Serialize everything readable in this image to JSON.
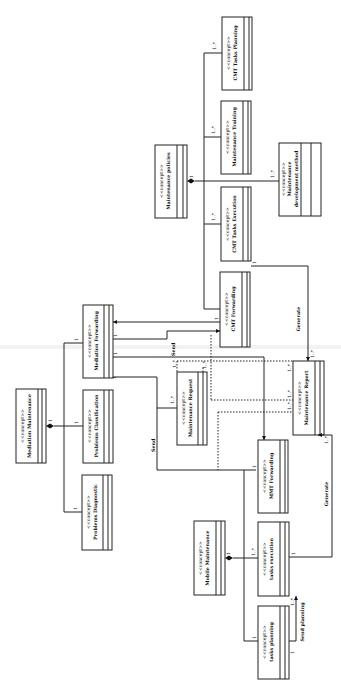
{
  "diagram": {
    "orientation": "rotated-90-ccw",
    "stereotype": "<<concept>>",
    "concepts": [
      {
        "id": "mediation_maintenance",
        "name": "Mediation Maintenance"
      },
      {
        "id": "problems_diagnostic",
        "name": "Problems Diagnostic"
      },
      {
        "id": "problems_classification",
        "name": "Problems Classification"
      },
      {
        "id": "mediation_forwarding",
        "name": "Mediation Forwarding"
      },
      {
        "id": "maintenance_request_small",
        "name": "Maintenance Request"
      },
      {
        "id": "cmt_forwarding",
        "name": "CMT Forwarding"
      },
      {
        "id": "cmt_tasks_execution",
        "name": "CMT Tasks Execution"
      },
      {
        "id": "maintenance_policies",
        "name": "Maintenance policies"
      },
      {
        "id": "maintenance_training",
        "name": "Maintenance Training"
      },
      {
        "id": "cmt_tasks_planning",
        "name": "CMT Tasks Planning"
      },
      {
        "id": "maintenance_development_method",
        "name_line1": "Maintenance",
        "name_line2": "development method"
      },
      {
        "id": "maintenance_report",
        "name": "Maintenance Report"
      },
      {
        "id": "mmt_forwarding",
        "name": "MMT Forwarding"
      },
      {
        "id": "mobile_maintenance",
        "name": "Mobile Maintenance"
      },
      {
        "id": "tasks_execution",
        "name": "tasks execution"
      },
      {
        "id": "tasks_planning",
        "name": "tasks planning"
      }
    ],
    "labels": {
      "send": "Send",
      "send2": "Send",
      "generate": "Generate",
      "generate2": "Generate",
      "send_planning": "Send planning"
    },
    "multiplicities": {
      "one": "1",
      "many": "1..*"
    }
  }
}
